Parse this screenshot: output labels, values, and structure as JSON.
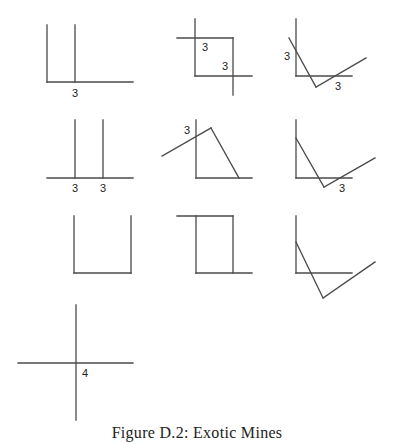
{
  "caption": "Figure D.2: Exotic Mines",
  "line_color": "#4a4a4a",
  "figures": [
    {
      "id": "fig-1",
      "lines": [
        [
          47,
          25,
          47,
          82
        ],
        [
          75,
          25,
          75,
          82
        ],
        [
          47,
          82,
          133,
          82
        ]
      ],
      "labels": [
        {
          "x": 72,
          "y": 97,
          "text": "3"
        }
      ]
    },
    {
      "id": "fig-2",
      "lines": [
        [
          195,
          19,
          195,
          76
        ],
        [
          177,
          38,
          233,
          38
        ],
        [
          233,
          38,
          233,
          95
        ],
        [
          195,
          76,
          252,
          76
        ]
      ],
      "labels": [
        {
          "x": 202,
          "y": 51,
          "text": "3"
        },
        {
          "x": 222,
          "y": 70,
          "text": "3"
        }
      ]
    },
    {
      "id": "fig-3",
      "lines": [
        [
          296,
          19,
          296,
          76
        ],
        [
          296,
          76,
          352,
          76
        ],
        [
          289,
          38,
          316,
          87
        ],
        [
          316,
          87,
          366,
          58
        ]
      ],
      "labels": [
        {
          "x": 284,
          "y": 60,
          "text": "3"
        },
        {
          "x": 335,
          "y": 90,
          "text": "3"
        }
      ]
    },
    {
      "id": "fig-4",
      "lines": [
        [
          75,
          120,
          75,
          178
        ],
        [
          103,
          120,
          103,
          178
        ],
        [
          47,
          178,
          133,
          178
        ]
      ],
      "labels": [
        {
          "x": 72,
          "y": 192,
          "text": "3"
        },
        {
          "x": 100,
          "y": 192,
          "text": "3"
        }
      ]
    },
    {
      "id": "fig-5",
      "lines": [
        [
          196,
          120,
          196,
          178
        ],
        [
          196,
          178,
          252,
          178
        ],
        [
          162,
          156,
          211,
          128
        ],
        [
          211,
          128,
          239,
          178
        ]
      ],
      "labels": [
        {
          "x": 184,
          "y": 134,
          "text": "3"
        }
      ]
    },
    {
      "id": "fig-6",
      "lines": [
        [
          296,
          120,
          296,
          178
        ],
        [
          296,
          178,
          352,
          178
        ],
        [
          296,
          138,
          324,
          187
        ],
        [
          324,
          187,
          375,
          158
        ]
      ],
      "labels": [
        {
          "x": 339,
          "y": 192,
          "text": "3"
        }
      ]
    },
    {
      "id": "fig-7",
      "lines": [
        [
          74,
          216,
          74,
          273
        ],
        [
          131,
          216,
          131,
          273
        ],
        [
          74,
          273,
          131,
          273
        ]
      ],
      "labels": []
    },
    {
      "id": "fig-8",
      "lines": [
        [
          177,
          216,
          233,
          216
        ],
        [
          196,
          216,
          196,
          273
        ],
        [
          233,
          216,
          233,
          273
        ],
        [
          196,
          273,
          252,
          273
        ]
      ],
      "labels": []
    },
    {
      "id": "fig-9",
      "lines": [
        [
          296,
          216,
          296,
          273
        ],
        [
          296,
          273,
          352,
          273
        ],
        [
          296,
          242,
          323,
          298
        ],
        [
          323,
          298,
          375,
          262
        ]
      ],
      "labels": []
    },
    {
      "id": "fig-10",
      "lines": [
        [
          76,
          305,
          76,
          420
        ],
        [
          18,
          363,
          133,
          363
        ]
      ],
      "labels": [
        {
          "x": 82,
          "y": 377,
          "text": "4"
        }
      ]
    }
  ]
}
